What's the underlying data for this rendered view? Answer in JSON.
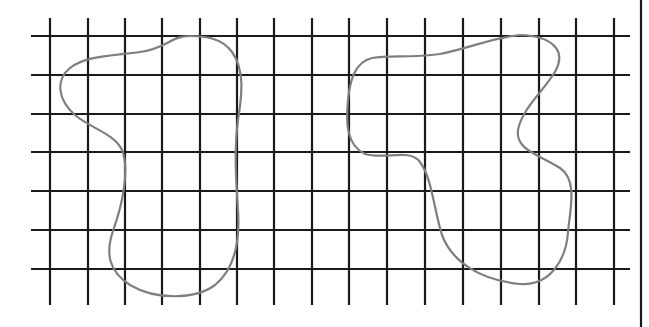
{
  "diagram": {
    "type": "grid-with-closed-curves",
    "colors": {
      "background": "#ffffff",
      "grid": "#1a1a1a",
      "curve": "#7f7f7f"
    },
    "grid": {
      "vertical_lines_x": [
        50,
        88,
        125,
        162,
        200,
        237,
        274,
        312,
        349,
        387,
        425,
        463,
        501,
        539,
        576,
        614
      ],
      "vertical_span_y": [
        18,
        305
      ],
      "horizontal_lines_y": [
        36,
        75,
        114,
        152,
        191,
        230,
        269
      ],
      "horizontal_span_x": [
        31,
        630
      ],
      "columns": 16,
      "rows": 7
    },
    "right_border_x": 641,
    "shapes": [
      {
        "name": "left-blob",
        "path": "M 190 36 C 170 36, 168 48, 140 52 C 110 56, 85 56, 70 68 C 55 80, 58 100, 75 115 C 90 128, 115 134, 122 150 C 130 170, 122 205, 114 228 C 104 255, 110 272, 130 285 C 155 300, 195 300, 215 285 C 236 268, 240 240, 238 210 C 236 180, 234 150, 238 120 C 242 95, 245 70, 232 52 C 222 38, 205 36, 190 36 Z"
      },
      {
        "name": "right-blob",
        "path": "M 520 35 C 495 37, 470 48, 440 54 C 410 58, 390 55, 372 58 C 355 62, 350 80, 348 100 C 346 122, 346 145, 365 154 C 385 160, 410 148, 420 162 C 432 178, 434 210, 442 235 C 452 262, 480 280, 520 284 C 550 286, 566 260, 568 232 C 570 210, 578 180, 560 168 C 540 155, 515 150, 518 130 C 522 108, 545 90, 556 70 C 566 50, 552 36, 520 35 Z"
      }
    ]
  }
}
